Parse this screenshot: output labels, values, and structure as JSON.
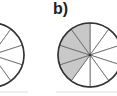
{
  "figure": {
    "label_b": "b)",
    "circle_a": {
      "slices": 10,
      "shaded_slices": [
        6
      ],
      "shade_color": "#c8c8c8",
      "partial": true
    },
    "circle_b": {
      "slices": 10,
      "shaded_slices": [
        6,
        7,
        8,
        9
      ],
      "shade_color": "#c8c8c8"
    },
    "line_color": "#333333"
  }
}
